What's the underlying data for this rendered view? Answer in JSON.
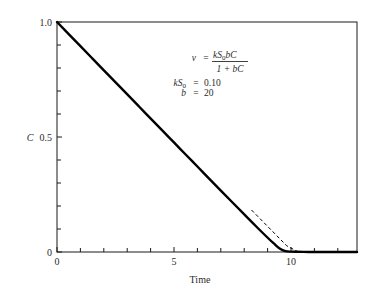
{
  "chart_data": {
    "type": "line",
    "title": "",
    "xlabel": "Time",
    "ylabel": "C",
    "xlim": [
      0,
      12.8
    ],
    "ylim": [
      0,
      1.0
    ],
    "grid": false,
    "legend": "none",
    "x_ticks_major": [
      0,
      5,
      10
    ],
    "x_tick_labels": [
      "0",
      "5",
      "10"
    ],
    "x_ticks_minor": [
      1,
      2,
      3,
      4,
      6,
      7,
      8,
      9,
      11,
      12
    ],
    "y_ticks_major": [
      0,
      0.5,
      1.0
    ],
    "y_tick_labels": [
      "0",
      "0.5",
      "1.0"
    ],
    "y_ticks_minor": [
      0.1,
      0.2,
      0.3,
      0.4,
      0.6,
      0.7,
      0.8,
      0.9
    ],
    "series": [
      {
        "name": "Michaelis-Menten decay",
        "style": "solid",
        "x": [
          0,
          0.5,
          1,
          1.5,
          2,
          2.5,
          3,
          3.5,
          4,
          4.5,
          5,
          5.5,
          6,
          6.5,
          7,
          7.5,
          8,
          8.5,
          9,
          9.25,
          9.5,
          9.75,
          10,
          10.25,
          10.5,
          10.75,
          11,
          11.25,
          11.5,
          11.75,
          12,
          12.25,
          12.5,
          12.8
        ],
        "y": [
          1.0,
          0.9475,
          0.895,
          0.8425,
          0.79,
          0.7375,
          0.685,
          0.6326,
          0.5801,
          0.5277,
          0.4752,
          0.4228,
          0.3705,
          0.3182,
          0.266,
          0.214,
          0.1622,
          0.1109,
          0.0609,
          0.0371,
          0.0152,
          0.0035,
          0.0015,
          0.0008,
          0.0005,
          0.0003,
          0.0002,
          0.0002,
          0.0001,
          0.0001,
          0.0001,
          0.0,
          0.0,
          0.0
        ]
      },
      {
        "name": "Zero-order asymptote",
        "style": "dashed",
        "x": [
          8.3,
          8.8,
          9.3,
          9.8,
          10.3,
          10.45
        ],
        "y": [
          0.1825,
          0.1307,
          0.0789,
          0.0271,
          0.0,
          0.0
        ]
      }
    ],
    "annotations": [
      {
        "name": "rate-equation",
        "kind": "equation",
        "lhs": "v",
        "equals": "=",
        "numerator": "kS",
        "numerator_sub": "0",
        "numerator_rest": "bC",
        "denominator": "1 + bC",
        "text": "v = kS0bC / (1 + bC)"
      },
      {
        "name": "parameter-kS0",
        "kind": "parameter",
        "symbol": "kS",
        "symbol_sub": "0",
        "equals": "=",
        "value": "0.10",
        "text": "kS0 = 0.10"
      },
      {
        "name": "parameter-b",
        "kind": "parameter",
        "symbol": "b",
        "symbol_sub": "",
        "equals": "=",
        "value": "20",
        "text": "b = 20"
      }
    ],
    "colors": {
      "curve": "#000000",
      "dashed": "#000000",
      "axis": "#1a1a1a",
      "text": "#2b2b2b",
      "background": "#ffffff"
    }
  }
}
